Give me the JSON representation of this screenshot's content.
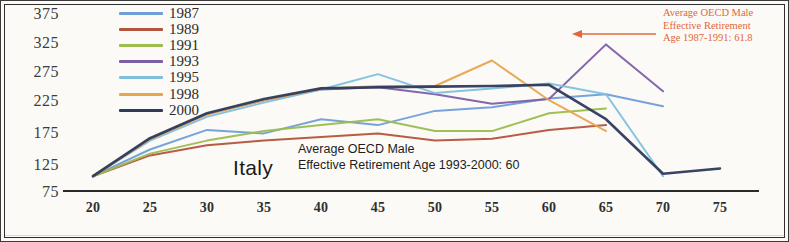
{
  "figure": {
    "country_label": "Italy",
    "background_color": "#fbfaf7",
    "border_color": "#2e2e2e"
  },
  "annotations": {
    "top_right": {
      "line1": "Average OECD Male",
      "line2": "Effective Retirement",
      "line3": "Age 1987-1991: 61.8",
      "color": "#e2673a",
      "arrow": "left-arrow"
    },
    "bottom": {
      "line1": "Average OECD Male",
      "line2": "Effective Retirement Age 1993-2000: 60",
      "color": "#1d1d1d"
    }
  },
  "legend": {
    "position": "top-left",
    "items": [
      {
        "label": "1987",
        "color": "#6f9fd8"
      },
      {
        "label": "1989",
        "color": "#b3543c"
      },
      {
        "label": "1991",
        "color": "#9cbc4e"
      },
      {
        "label": "1993",
        "color": "#7c5ea6"
      },
      {
        "label": "1995",
        "color": "#7ec0de"
      },
      {
        "label": "1998",
        "color": "#e8a44c"
      },
      {
        "label": "2000",
        "color": "#2d3a5c"
      }
    ]
  },
  "chart_data": {
    "type": "line",
    "title": "",
    "xlabel": "",
    "ylabel": "",
    "xlim": [
      20,
      77
    ],
    "ylim": [
      75,
      375
    ],
    "xticks": [
      20,
      25,
      30,
      35,
      40,
      45,
      50,
      55,
      60,
      65,
      70,
      75
    ],
    "yticks": [
      75,
      125,
      175,
      225,
      275,
      325,
      375
    ],
    "grid": false,
    "legend_position": "top-left",
    "x": [
      20,
      25,
      30,
      35,
      40,
      45,
      50,
      55,
      60,
      65,
      70,
      75
    ],
    "series": [
      {
        "name": "1987",
        "color": "#6f9fd8",
        "values": [
          100,
          145,
          178,
          172,
          196,
          186,
          210,
          216,
          231,
          238,
          218,
          null
        ]
      },
      {
        "name": "1989",
        "color": "#b3543c",
        "values": [
          100,
          135,
          152,
          160,
          166,
          172,
          160,
          163,
          178,
          186,
          null,
          null
        ]
      },
      {
        "name": "1991",
        "color": "#9cbc4e",
        "values": [
          100,
          138,
          160,
          176,
          186,
          196,
          176,
          176,
          206,
          214,
          null,
          null
        ]
      },
      {
        "name": "1993",
        "color": "#7c5ea6",
        "values": [
          100,
          163,
          205,
          228,
          246,
          250,
          238,
          222,
          230,
          322,
          243,
          null
        ]
      },
      {
        "name": "1995",
        "color": "#7ec0de",
        "values": [
          100,
          160,
          200,
          224,
          246,
          272,
          240,
          248,
          256,
          238,
          100,
          null
        ]
      },
      {
        "name": "1998",
        "color": "#e8a44c",
        "values": [
          100,
          162,
          204,
          228,
          247,
          252,
          252,
          295,
          228,
          176,
          null,
          null
        ]
      },
      {
        "name": "2000",
        "color": "#2d3a5c",
        "values": [
          100,
          164,
          206,
          230,
          248,
          250,
          251,
          252,
          254,
          196,
          104,
          113
        ]
      }
    ]
  }
}
